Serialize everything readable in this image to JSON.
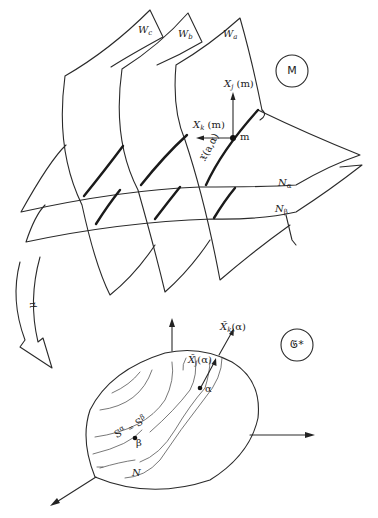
{
  "diagram": {
    "upper_space": {
      "circle_label": "M",
      "sheets": [
        {
          "name": "W",
          "sub": "c"
        },
        {
          "name": "W",
          "sub": "b"
        },
        {
          "name": "W",
          "sub": "a"
        }
      ],
      "level_sets": [
        {
          "name": "N",
          "sub": "α"
        },
        {
          "name": "N",
          "sub": "β"
        }
      ],
      "point_label": "m",
      "vector_j": "X",
      "vector_j_sub": "j",
      "vector_j_arg": "(m)",
      "vector_k": "X",
      "vector_k_sub": "k",
      "vector_k_arg": "(m)",
      "curve_label": "𝔛(a,α)"
    },
    "map": {
      "label": "μ"
    },
    "lower_space": {
      "circle_label": "𝔊*",
      "vector_k": "X̃",
      "vector_k_sub": "k",
      "vector_k_arg": "(α)",
      "vector_j": "X̃",
      "vector_j_sub": "j",
      "vector_j_arg": "(α)",
      "point_alpha": "α",
      "point_beta": "β",
      "contour_label": "S",
      "contour_sup_a": "α",
      "contour_eq": "=",
      "contour_sup_b": "β",
      "level_label": "N"
    }
  }
}
